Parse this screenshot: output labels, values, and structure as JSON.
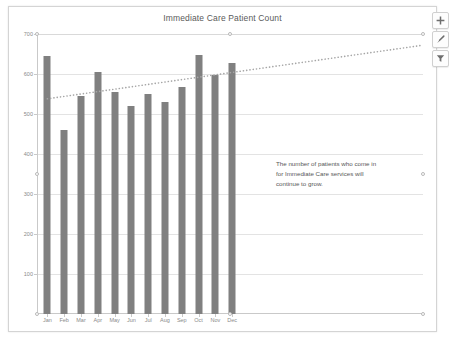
{
  "chart_data": {
    "type": "bar",
    "title": "Immediate Care Patient Count",
    "xlabel": "",
    "ylabel": "",
    "categories": [
      "Jan",
      "Feb",
      "Mar",
      "Apr",
      "May",
      "Jun",
      "Jul",
      "Aug",
      "Sep",
      "Oct",
      "Nov",
      "Dec"
    ],
    "values": [
      645,
      460,
      545,
      605,
      555,
      520,
      550,
      530,
      567,
      648,
      597,
      627
    ],
    "series": [
      {
        "name": "Patient Count",
        "type": "bar",
        "color": "#808080",
        "values": [
          645,
          460,
          545,
          605,
          555,
          520,
          550,
          530,
          567,
          648,
          597,
          627
        ]
      },
      {
        "name": "Trendline (Linear)",
        "type": "line",
        "style": "dotted",
        "color": "#a6a6a6",
        "values": [
          538,
          546,
          554,
          562,
          570,
          578,
          586,
          594,
          602,
          610,
          618,
          626
        ],
        "extends_past_data": true,
        "end_value": 672
      }
    ],
    "ylim": [
      0,
      700
    ],
    "yticks": [
      0,
      100,
      200,
      300,
      400,
      500,
      600,
      700
    ],
    "ytick_labels": [
      "",
      "100",
      "200",
      "300",
      "400",
      "500",
      "600",
      "700"
    ],
    "grid": true,
    "gridlines": "horizontal",
    "legend": false,
    "annotations": [
      {
        "name": "growth-note",
        "text": "The number of patients who come in for Immediate Care services will continue to grow."
      }
    ]
  },
  "chart": {
    "title": "Immediate Care Patient Count"
  },
  "annotation": {
    "line1": "The number of patients who come in",
    "line2": "for Immediate Care services will",
    "line3": "continue to grow."
  },
  "tools": {
    "chart_elements_label": "Chart Elements",
    "chart_styles_label": "Chart Styles",
    "chart_filters_label": "Chart Filters"
  },
  "colors": {
    "bar": "#808080",
    "trendline": "#a6a6a6",
    "grid": "#e3e3e3",
    "axis": "#c9c9c9",
    "text": "#8a8a8a",
    "title_text": "#5a5a5a",
    "frame": "#d4d4d4"
  }
}
